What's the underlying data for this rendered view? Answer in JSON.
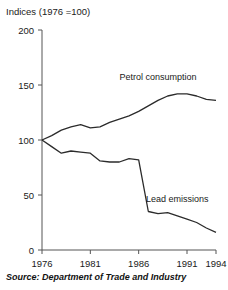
{
  "clipped_top_text": "",
  "axis_unit_label": "Indices (1976 =100)",
  "source": "Source: Department of Trade and Industry",
  "labels": {
    "petrol": "Petrol consumption",
    "lead": "Lead emissions"
  },
  "chart_data": {
    "type": "line",
    "title": "Indices (1976 =100)",
    "xlabel": "",
    "ylabel": "Indices (1976 =100)",
    "xlim": [
      1976,
      1994
    ],
    "ylim": [
      0,
      200
    ],
    "yticks": [
      0,
      50,
      100,
      150,
      200
    ],
    "ytick_labels": [
      "0",
      "50",
      "100",
      "150",
      "200"
    ],
    "xticks": [
      1976,
      1981,
      1986,
      1991,
      1994
    ],
    "xtick_labels": [
      "1976",
      "1981",
      "1986",
      "1991",
      "1994"
    ],
    "grid": false,
    "legend": "inline-annotations",
    "x": [
      1976,
      1977,
      1978,
      1979,
      1980,
      1981,
      1982,
      1983,
      1984,
      1985,
      1986,
      1987,
      1988,
      1989,
      1990,
      1991,
      1992,
      1993,
      1994
    ],
    "series": [
      {
        "name": "Petrol consumption",
        "color": "#2b2b2b",
        "label_x": 1988,
        "label_y": 155,
        "values": [
          100,
          104,
          109,
          112,
          114,
          111,
          112,
          116,
          119,
          122,
          126,
          131,
          136,
          140,
          142,
          142,
          140,
          137,
          136
        ]
      },
      {
        "name": "Lead emissions",
        "color": "#2b2b2b",
        "label_x": 1990,
        "label_y": 44,
        "values": [
          100,
          94,
          88,
          90,
          89,
          88,
          81,
          80,
          80,
          83,
          82,
          35,
          33,
          34,
          31,
          28,
          25,
          20,
          16
        ]
      }
    ]
  }
}
